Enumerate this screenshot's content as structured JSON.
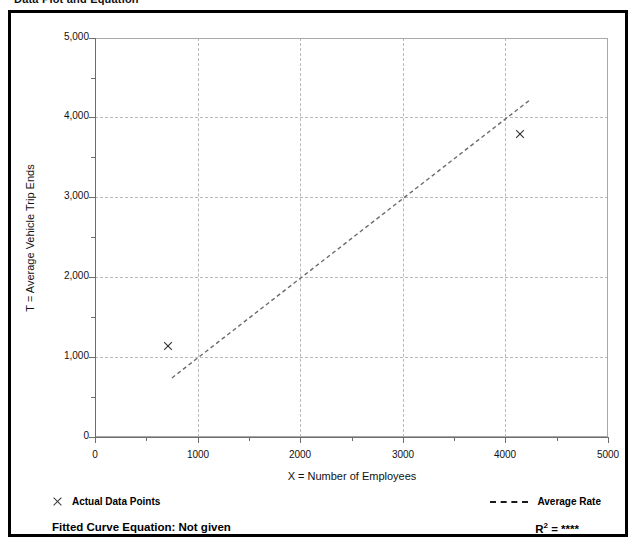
{
  "caption": "Data Plot and Equation",
  "chart_data": {
    "type": "scatter",
    "title": "Data Plot and Equation",
    "xlabel": "X = Number of Employees",
    "ylabel": "T = Average Vehicle Trip Ends",
    "xlim": [
      0,
      5000
    ],
    "ylim": [
      0,
      5000
    ],
    "xticks": [
      "0",
      "1000",
      "2000",
      "3000",
      "4000",
      "5000"
    ],
    "xtick_values": [
      0,
      1000,
      2000,
      3000,
      4000,
      5000
    ],
    "yticks": [
      "0",
      "1,000",
      "2,000",
      "3,000",
      "4,000",
      "5,000"
    ],
    "ytick_values": [
      0,
      1000,
      2000,
      3000,
      4000,
      5000
    ],
    "grid": true,
    "legend_position": "below-axes",
    "series": [
      {
        "name": "Actual Data Points",
        "type": "scatter",
        "marker": "x",
        "points": [
          {
            "x": 712,
            "y": 1140
          },
          {
            "x": 4142,
            "y": 3798
          }
        ]
      },
      {
        "name": "Average Rate",
        "type": "line",
        "style": "dashed",
        "points": [
          {
            "x": 750,
            "y": 740
          },
          {
            "x": 4240,
            "y": 4225
          }
        ]
      }
    ]
  },
  "axes": {
    "y_title": "T = Average Vehicle Trip Ends",
    "x_title": "X = Number of Employees",
    "y_tick_labels": [
      "5,000",
      "4,000",
      "3,000",
      "2,000",
      "1,000",
      "0"
    ],
    "x_tick_labels": [
      "0",
      "1000",
      "2000",
      "3000",
      "4000",
      "5000"
    ]
  },
  "legend": {
    "actual_points_label": "Actual Data Points",
    "average_rate_label": "Average Rate"
  },
  "footer": {
    "equation_label": "Fitted Curve Equation:  Not given",
    "r2_prefix": "R",
    "r2_superscript": "2",
    "r2_value": "= ****"
  }
}
